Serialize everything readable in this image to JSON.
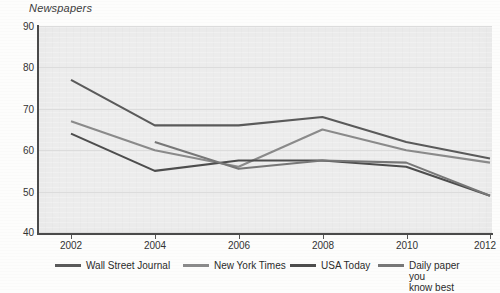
{
  "chart_data": {
    "type": "line",
    "title": "Newspapers",
    "xlabel": "",
    "ylabel": "",
    "x": [
      2002,
      2004,
      2006,
      2008,
      2010,
      2012
    ],
    "categories": [
      "2002",
      "2004",
      "2006",
      "2008",
      "2010",
      "2012"
    ],
    "ylim": [
      40,
      90
    ],
    "yticks": [
      40,
      50,
      60,
      70,
      80,
      90
    ],
    "ytick_labels": [
      "40",
      "50",
      "60",
      "70",
      "80",
      "90"
    ],
    "xlim": [
      2002,
      2012
    ],
    "grid": true,
    "legend_position": "bottom",
    "series": [
      {
        "name": "Wall Street Journal",
        "color": "#5a5a5a",
        "x": [
          2002,
          2004,
          2006,
          2008,
          2010,
          2012
        ],
        "values": [
          77,
          66,
          66,
          68,
          62,
          58
        ]
      },
      {
        "name": "New York Times",
        "color": "#8a8a8a",
        "x": [
          2002,
          2004,
          2006,
          2008,
          2010,
          2012
        ],
        "values": [
          67,
          60,
          56,
          65,
          60,
          57
        ]
      },
      {
        "name": "USA Today",
        "color": "#4d4d4d",
        "x": [
          2002,
          2004,
          2006,
          2008,
          2010,
          2012
        ],
        "values": [
          64,
          55,
          57.5,
          57.5,
          56,
          49
        ]
      },
      {
        "name": "Daily paper you know best",
        "color": "#777777",
        "x": [
          2004,
          2006,
          2008,
          2010,
          2012
        ],
        "values": [
          62,
          55.5,
          57.5,
          57,
          49
        ]
      }
    ]
  },
  "legend": {
    "items": [
      {
        "label": "Wall Street Journal",
        "color": "#5a5a5a"
      },
      {
        "label": "New York Times",
        "color": "#8a8a8a"
      },
      {
        "label": "USA Today",
        "color": "#4d4d4d"
      },
      {
        "label_line1": "Daily paper you",
        "label_line2": "know best",
        "label": "Daily paper you know best",
        "color": "#777777"
      }
    ]
  },
  "axes": {
    "y_labels": [
      "90",
      "80",
      "70",
      "60",
      "50",
      "40"
    ],
    "x_labels": [
      "2002",
      "2004",
      "2006",
      "2008",
      "2010",
      "2012"
    ]
  }
}
